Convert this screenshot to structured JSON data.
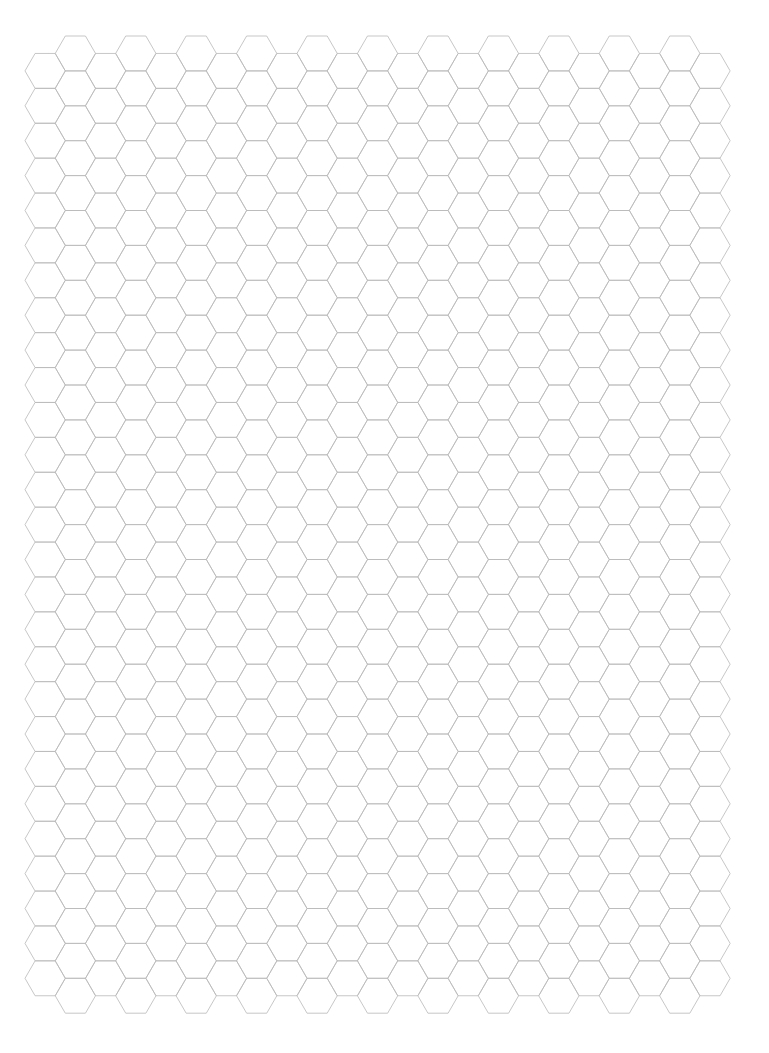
{
  "page": {
    "type": "hexagonal-graph-paper",
    "width": 769,
    "height": 1053,
    "background_color": "#ffffff"
  },
  "hex_grid": {
    "orientation": "flat-top",
    "line_color": "#b9b9b9",
    "vertex_color": "#9a9a9a",
    "line_width": 0.8,
    "hex_side": 20.15,
    "hex_width": 40.3,
    "hex_height": 34.9,
    "column_spacing": 30.22,
    "columns": 23,
    "margin_left": 25,
    "odd_column_top": 36,
    "even_column_top": 53.45,
    "odd_column_rows": 28,
    "even_column_rows": 27
  }
}
